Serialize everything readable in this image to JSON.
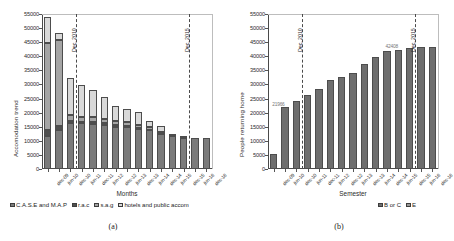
{
  "figure": {
    "panels": [
      {
        "id": "a",
        "caption": "(a)",
        "chart_data": {
          "type": "bar",
          "subtype": "stacked-bar",
          "title": "",
          "xlabel": "Months",
          "ylabel": "Accomodation trend",
          "ylim": [
            0,
            55000
          ],
          "ystep": 5000,
          "yticks": [
            "0",
            "5000",
            "10000",
            "15000",
            "20000",
            "25000",
            "30000",
            "35000",
            "40000",
            "45000",
            "50000",
            "55000"
          ],
          "grid": false,
          "legend_position": "bottom",
          "categories": [
            "dec-09",
            "jun-10",
            "dec-10",
            "jun-11",
            "dec-11",
            "jun-12",
            "dec-12",
            "jun-13",
            "dec-13",
            "jun-14",
            "dec-14",
            "jun-15",
            "dec-15",
            "jun-16",
            "dec-16"
          ],
          "series": [
            {
              "name": "C.A.S.E and M.A.P",
              "color": "#7b7b7b",
              "values": [
                11800,
                13800,
                16400,
                16200,
                16000,
                15700,
                15000,
                14900,
                14100,
                13900,
                12400,
                11600,
                11100,
                11000,
                11000
              ]
            },
            {
              "name": "r.a.c",
              "color": "#4f4f4f",
              "values": [
                1900,
                1300,
                800,
                500,
                700,
                600,
                550,
                500,
                400,
                0,
                0,
                0,
                0,
                0,
                0
              ]
            },
            {
              "name": "s.a.g",
              "color": "#a5a5a5",
              "values": [
                31100,
                30700,
                1900,
                1800,
                1700,
                1500,
                1400,
                1300,
                1200,
                1000,
                900,
                0,
                0,
                0,
                0
              ]
            },
            {
              "name": "hotels and public accommodation",
              "color": "#d9d9d9",
              "values": [
                9100,
                2400,
                13100,
                11300,
                9800,
                7900,
                5400,
                4500,
                4400,
                2200,
                1900,
                800,
                500,
                0,
                0
              ]
            }
          ],
          "annotations": [
            {
              "label": "Dec, 2010",
              "x_category": "dec-10"
            },
            {
              "label": "Dec, 2015",
              "x_category": "dec-15"
            }
          ]
        }
      },
      {
        "id": "b",
        "caption": "(b)",
        "chart_data": {
          "type": "bar",
          "subtype": "stacked-bar",
          "title": "",
          "xlabel": "Semester",
          "ylabel": "People returning home",
          "ylim": [
            0,
            55000
          ],
          "ystep": 5000,
          "yticks": [
            "0",
            "5000",
            "10000",
            "15000",
            "20000",
            "25000",
            "30000",
            "35000",
            "40000",
            "45000",
            "50000",
            "55000"
          ],
          "grid": false,
          "legend_position": "bottom-right",
          "categories": [
            "dec-09",
            "jun-10",
            "dec-10",
            "jun-11",
            "dec-11",
            "jun-12",
            "dec-12",
            "jun-13",
            "dec-13",
            "jun-14",
            "dec-14",
            "jun-15",
            "dec-15",
            "jun-16",
            "dec-16"
          ],
          "series": [
            {
              "name": "B or C",
              "color": "#6e6e6e",
              "values": [
                5500,
                21966,
                24200,
                26200,
                28400,
                31700,
                32500,
                34200,
                37100,
                39600,
                41700,
                42408,
                43100,
                43400,
                43400
              ]
            },
            {
              "name": "E",
              "color": "#9a9a9a",
              "values": [
                0,
                0,
                0,
                0,
                0,
                0,
                0,
                0,
                0,
                0,
                0,
                0,
                0,
                0,
                0
              ]
            }
          ],
          "annotations": [
            {
              "label": "Dec, 2010",
              "x_category": "dec-10"
            },
            {
              "label": "Dec, 2015",
              "x_category": "dec-15"
            }
          ],
          "data_labels": [
            {
              "text": "21966",
              "x_category": "jun-10",
              "value": 21966
            },
            {
              "text": "42408",
              "x_category": "jun-15",
              "value": 42408
            }
          ]
        }
      }
    ]
  }
}
